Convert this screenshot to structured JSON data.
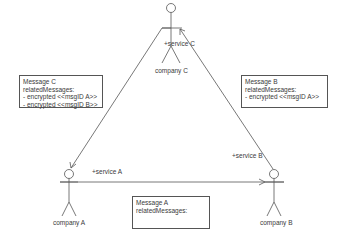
{
  "actors": {
    "a": {
      "name": "company A"
    },
    "b": {
      "name": "company B"
    },
    "c": {
      "name": "company C"
    }
  },
  "services": {
    "a": "+service A",
    "b": "+service B",
    "c": "+service C"
  },
  "notes": {
    "c": {
      "title": "Message C",
      "subtitle": "relatedMessages:",
      "items": [
        "- encrypted <<msgID A>>",
        "- encrypted <<msgID B>>"
      ]
    },
    "b": {
      "title": "Message B",
      "subtitle": "relatedMessages:",
      "items": [
        "- encrypted <<msgID A>>"
      ]
    },
    "a": {
      "title": "Message A",
      "subtitle": "relatedMessages:",
      "items": []
    }
  },
  "colors": {
    "line": "#555555",
    "text": "#3a3a3a",
    "background": "#ffffff"
  }
}
